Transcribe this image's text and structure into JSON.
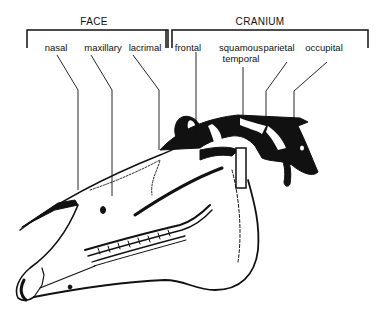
{
  "diagram": {
    "groups": [
      {
        "id": "face",
        "title": "FACE",
        "bracket": {
          "x1": 27,
          "x2": 168,
          "y": 30,
          "drop": 18
        },
        "title_pos": {
          "x": 94,
          "y": 16
        }
      },
      {
        "id": "cranium",
        "title": "CRANIUM",
        "bracket": {
          "x1": 172,
          "x2": 368,
          "y": 30,
          "drop": 18
        },
        "title_pos": {
          "x": 260,
          "y": 16
        }
      }
    ],
    "labels": [
      {
        "id": "nasal",
        "text": "nasal",
        "group": "FACE",
        "x": 56,
        "y": 42
      },
      {
        "id": "maxillary",
        "text": "maxillary",
        "group": "FACE",
        "x": 103,
        "y": 42
      },
      {
        "id": "lacrimal",
        "text": "lacrimal",
        "group": "FACE",
        "x": 145,
        "y": 42
      },
      {
        "id": "frontal",
        "text": "frontal",
        "group": "CRANIUM",
        "x": 188,
        "y": 42
      },
      {
        "id": "squamous-temporal",
        "text": "squamous",
        "text2": "temporal",
        "group": "CRANIUM",
        "x": 241,
        "y": 42
      },
      {
        "id": "parietal",
        "text": "parietal",
        "group": "CRANIUM",
        "x": 279,
        "y": 42
      },
      {
        "id": "occupital",
        "text": "occupital",
        "group": "CRANIUM",
        "x": 324,
        "y": 42
      }
    ],
    "leaders": [
      {
        "for": "nasal",
        "points": "57,55 78,90 78,190"
      },
      {
        "for": "maxillary",
        "points": "91,55 112,90 112,196"
      },
      {
        "for": "lacrimal",
        "points": "133,55 159,90 159,150"
      },
      {
        "for": "frontal",
        "points": "196,52 196,135"
      },
      {
        "for": "squamous-temporal",
        "points": "243,67 243,115"
      },
      {
        "for": "parietal",
        "points": "287,62 266,91 266,118"
      },
      {
        "for": "occupital",
        "points": "327,62 294,91 294,120"
      }
    ],
    "colors": {
      "ink": "#111111",
      "paper": "#ffffff"
    }
  }
}
